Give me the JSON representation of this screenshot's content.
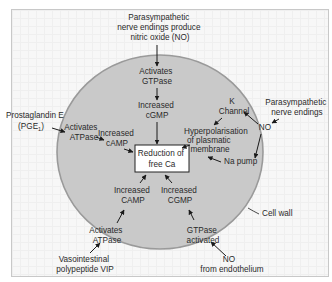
{
  "diagram": {
    "colors": {
      "cell_fill": "#c9c9c9",
      "cell_stroke": "#9a9a9a",
      "background": "#f7f7f7",
      "text": "#2a2a2a",
      "box_fill": "#ffffff",
      "box_stroke": "#222222"
    },
    "center_box": {
      "line1": "Reduction of",
      "line2": "free Ca"
    },
    "nodes": {
      "top_source": {
        "line1": "Parasympathetic",
        "line2": "nerve endings produce",
        "line3": "nitric oxide (NO)"
      },
      "activates_gtpase": {
        "line1": "Activates",
        "line2": "GTPase"
      },
      "increased_cgmp_top": {
        "line1": "Increased",
        "line2": "cGMP"
      },
      "prostaglandin": {
        "line1": "Prostaglandin E",
        "line2": "(PGE",
        "sub": "1",
        "line2_end": ")"
      },
      "activates_atpase_left": {
        "line1": "Activates",
        "line2": "ATPase"
      },
      "increased_camp_left": {
        "line1": "Increased",
        "line2": "cAMP"
      },
      "k_channel": {
        "line1": "K",
        "line2": "Channel"
      },
      "hyperpolarisation": {
        "line1": "Hyperpolarisation",
        "line2": "of plasmatic",
        "line3": "membrane"
      },
      "na_pump": {
        "line1": "Na pump"
      },
      "no_right": {
        "line1": "NO"
      },
      "parasympathetic_right": {
        "line1": "Parasympathetic",
        "line2": "nerve endings"
      },
      "cell_wall": {
        "line1": "Cell wall"
      },
      "increased_camp_bottom": {
        "line1": "Increased",
        "line2": "CAMP"
      },
      "increased_cgmp_bottom": {
        "line1": "Increased",
        "line2": "CGMP"
      },
      "activates_atpase_bottom": {
        "line1": "Activates",
        "line2": "ATPase"
      },
      "gtpase_activated": {
        "line1": "GTPase",
        "line2": "activated"
      },
      "vip": {
        "line1": "Vasointestinal",
        "line2": "polypeptide VIP"
      },
      "no_endothelium": {
        "line1": "NO",
        "line2": "from endothelium"
      }
    }
  }
}
